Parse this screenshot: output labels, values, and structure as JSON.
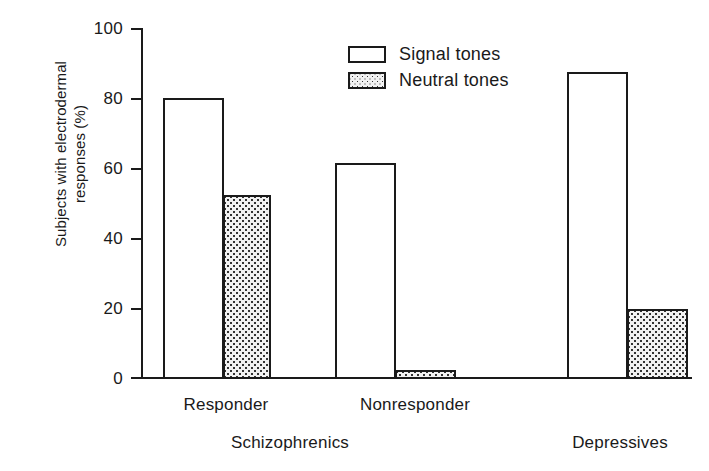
{
  "chart_data": {
    "type": "bar",
    "title": "",
    "xlabel": "",
    "ylabel": "Subjects with electrodermal\nresponses (%)",
    "ylim": [
      0,
      100
    ],
    "yticks": [
      0,
      20,
      40,
      60,
      80,
      100
    ],
    "ytick_labels": [
      "0",
      "20",
      "40",
      "60",
      "80",
      "100"
    ],
    "grid": false,
    "legend_position": "upper center",
    "categories": [
      "Responder",
      "Nonresponder",
      "Depressives"
    ],
    "group_labels": [
      "Schizophrenics",
      "Depressives"
    ],
    "series": [
      {
        "name": "Signal tones",
        "fill": "open",
        "values": [
          80,
          61.5,
          87.5
        ]
      },
      {
        "name": "Neutral tones",
        "fill": "stippled",
        "values": [
          52.5,
          2.5,
          20
        ]
      }
    ],
    "bars": [
      {
        "category": "Responder",
        "series": "Signal tones",
        "value": 80,
        "left_px": 163,
        "width_px": 61
      },
      {
        "category": "Responder",
        "series": "Neutral tones",
        "value": 52.5,
        "left_px": 223,
        "width_px": 48
      },
      {
        "category": "Nonresponder",
        "series": "Signal tones",
        "value": 61.5,
        "left_px": 335,
        "width_px": 61
      },
      {
        "category": "Nonresponder",
        "series": "Neutral tones",
        "value": 2.5,
        "left_px": 395,
        "width_px": 61
      },
      {
        "category": "Depressives",
        "series": "Signal tones",
        "value": 87.5,
        "left_px": 567,
        "width_px": 61
      },
      {
        "category": "Depressives",
        "series": "Neutral tones",
        "value": 20,
        "left_px": 627,
        "width_px": 61
      }
    ],
    "colors": {
      "axis": "#1a1a1a",
      "signal_fill": "#ffffff",
      "neutral_fill": "#f2f2f2",
      "stipple_dot": "#333333",
      "background": "#ffffff"
    }
  },
  "axis": {
    "y_title_line1": "Subjects with electrodermal",
    "y_title_line2": "responses (%)",
    "y_ticks": [
      "100",
      "80",
      "60",
      "40",
      "20",
      "0"
    ]
  },
  "legend": {
    "items": [
      {
        "label": "Signal tones"
      },
      {
        "label": "Neutral tones"
      }
    ]
  },
  "x_labels": {
    "sub": [
      "Responder",
      "Nonresponder"
    ],
    "groups": [
      "Schizophrenics",
      "Depressives"
    ]
  }
}
